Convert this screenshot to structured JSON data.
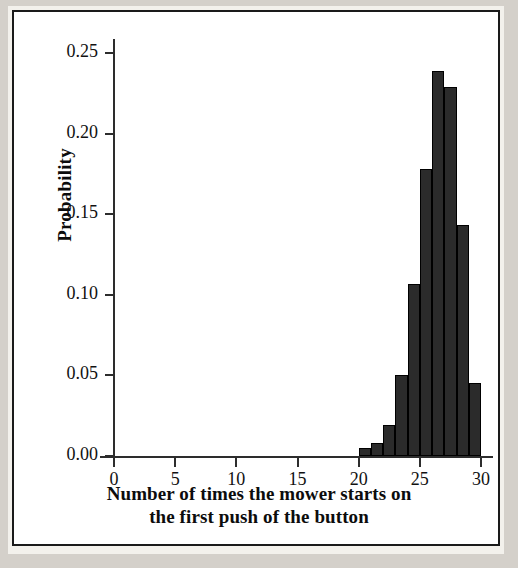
{
  "chart_data": {
    "type": "bar",
    "title": "",
    "subtitle": "",
    "xlabel": "Number of times the mower starts on the first push of the button",
    "xlabel_line1": "Number of times the mower starts on",
    "xlabel_line2": "the first push of the button",
    "ylabel": "Probability",
    "xlim": [
      0,
      31
    ],
    "ylim": [
      0.0,
      0.26
    ],
    "grid": false,
    "legend": false,
    "bar_color": "#2b2b2b",
    "bar_edge_color": "#000000",
    "xticks": [
      0,
      5,
      10,
      15,
      20,
      25,
      30
    ],
    "xtick_labels": [
      "0",
      "5",
      "10",
      "15",
      "20",
      "25",
      "30"
    ],
    "yticks": [
      0.0,
      0.05,
      0.1,
      0.15,
      0.2,
      0.25
    ],
    "ytick_labels": [
      "0.00",
      "0.05",
      "0.10",
      "0.15",
      "0.20",
      "0.25"
    ],
    "categories": [
      20,
      21,
      22,
      23,
      24,
      25,
      26,
      27,
      28,
      29,
      30
    ],
    "values": [
      0.005,
      0.008,
      0.019,
      0.05,
      0.107,
      0.178,
      0.239,
      0.229,
      0.143,
      0.045,
      0.0
    ],
    "bars": [
      {
        "x": 20,
        "value": 0.005
      },
      {
        "x": 21,
        "value": 0.008
      },
      {
        "x": 22,
        "value": 0.019
      },
      {
        "x": 23,
        "value": 0.05
      },
      {
        "x": 24,
        "value": 0.107
      },
      {
        "x": 25,
        "value": 0.178
      },
      {
        "x": 26,
        "value": 0.239
      },
      {
        "x": 27,
        "value": 0.229
      },
      {
        "x": 28,
        "value": 0.143
      },
      {
        "x": 29,
        "value": 0.045
      }
    ]
  }
}
